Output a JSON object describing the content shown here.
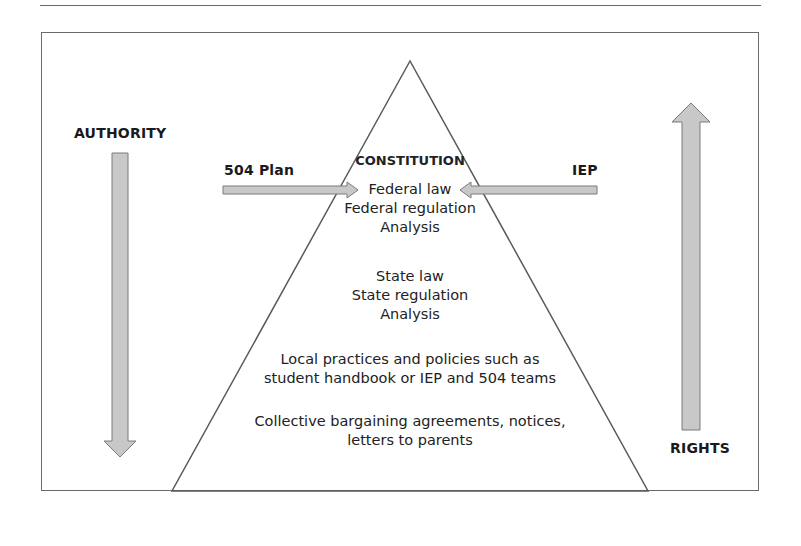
{
  "diagram": {
    "labels": {
      "authority": "AUTHORITY",
      "rights": "RIGHTS",
      "plan_504": "504 Plan",
      "iep": "IEP"
    },
    "pyramid": {
      "apex_label": "CONSTITUTION",
      "tiers": [
        {
          "lines": [
            "Federal law",
            "Federal regulation",
            "Analysis"
          ]
        },
        {
          "lines": [
            "State law",
            "State regulation",
            "Analysis"
          ]
        },
        {
          "lines": [
            "Local practices and policies such as",
            "student handbook or IEP and 504 teams"
          ]
        },
        {
          "lines": [
            "Collective bargaining agreements, notices,",
            "letters to parents"
          ]
        }
      ]
    },
    "arrows": {
      "authority": "down",
      "rights": "up",
      "plan_504": "points right to Federal law",
      "iep": "points left to Federal law"
    },
    "colors": {
      "arrow_fill": "#c8c8c8",
      "arrow_stroke": "#7a7a7a",
      "line": "#5a5a5a"
    }
  }
}
